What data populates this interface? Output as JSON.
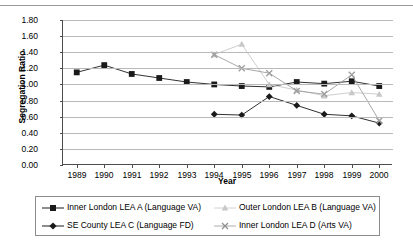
{
  "chart_data": {
    "type": "line",
    "title": "",
    "xlabel": "Year",
    "ylabel": "Segregation Ratio",
    "x": [
      1989,
      1990,
      1991,
      1992,
      1993,
      1994,
      1995,
      1996,
      1997,
      1998,
      1999,
      2000
    ],
    "xticklabels": [
      "1989",
      "1990",
      "1991",
      "1992",
      "1993",
      "1994",
      "1995",
      "1996",
      "1997",
      "1998",
      "1999",
      "2000"
    ],
    "yticklabels": [
      "0.00",
      "0.20",
      "0.40",
      "0.60",
      "0.80",
      "1.00",
      "1.20",
      "1.40",
      "1.60",
      "1.80"
    ],
    "ylim": [
      0.0,
      1.8
    ],
    "ytick_step": 0.2,
    "grid": true,
    "legend_position": "bottom",
    "series": [
      {
        "name": "Inner London LEA A (Language VA)",
        "marker": "square",
        "color": "#1a1a1a",
        "x": [
          1989,
          1990,
          1991,
          1992,
          1993,
          1994,
          1995,
          1996,
          1997,
          1998,
          1999,
          2000
        ],
        "values": [
          1.15,
          1.24,
          1.13,
          1.08,
          1.03,
          1.0,
          0.98,
          0.97,
          1.03,
          1.01,
          1.04,
          0.98
        ]
      },
      {
        "name": "SE County LEA C (Language FD)",
        "marker": "diamond",
        "color": "#1a1a1a",
        "x": [
          1994,
          1995,
          1996,
          1997,
          1998,
          1999,
          2000
        ],
        "values": [
          0.63,
          0.62,
          0.85,
          0.74,
          0.63,
          0.61,
          0.52
        ]
      },
      {
        "name": "Outer London LEA B (Language VA)",
        "marker": "triangle",
        "color": "#c8c8c8",
        "x": [
          1994,
          1995,
          1996,
          1997,
          1998,
          1999,
          2000
        ],
        "values": [
          1.37,
          1.5,
          1.0,
          0.93,
          0.86,
          0.9,
          0.88
        ]
      },
      {
        "name": "Inner London LEA D (Arts VA)",
        "marker": "cross",
        "color": "#9e9e9e",
        "x": [
          1994,
          1995,
          1996,
          1997,
          1998,
          1999,
          2000
        ],
        "values": [
          1.37,
          1.2,
          1.14,
          0.92,
          0.88,
          1.12,
          0.55
        ]
      }
    ]
  },
  "legend": {
    "entries": [
      {
        "label": "Inner London LEA A (Language VA)"
      },
      {
        "label": "Outer London LEA B (Language VA)"
      },
      {
        "label": "SE County LEA C (Language FD)"
      },
      {
        "label": "Inner London LEA D (Arts VA)"
      }
    ]
  }
}
